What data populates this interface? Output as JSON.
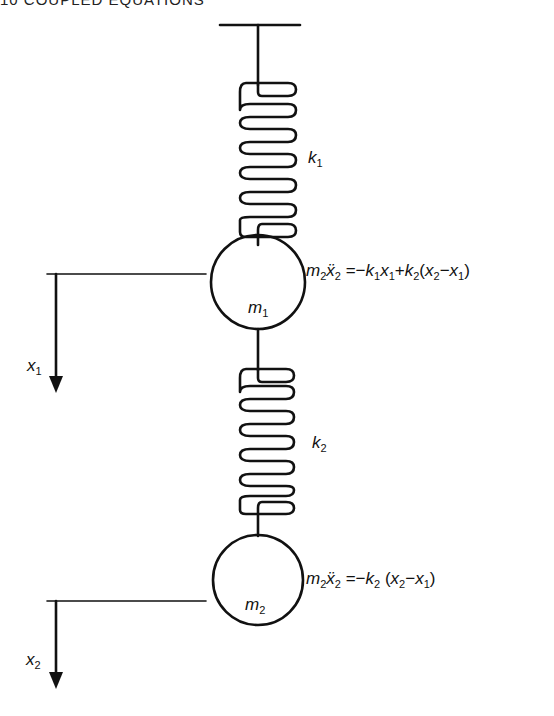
{
  "page": {
    "header": "10   COUPLED EQUATIONS"
  },
  "diagram": {
    "spring1": {
      "symbol": "k",
      "index": "1"
    },
    "spring2": {
      "symbol": "k",
      "index": "2"
    },
    "mass1": {
      "symbol": "m",
      "index": "1"
    },
    "mass2": {
      "symbol": "m",
      "index": "2"
    },
    "displacement1": {
      "symbol": "x",
      "index": "1"
    },
    "displacement2": {
      "symbol": "x",
      "index": "2"
    },
    "equation1": {
      "lhs_m": "m",
      "lhs_m_idx": "2",
      "lhs_x": "ẍ",
      "lhs_x_idx": "2",
      "eq": "=",
      "t1_sign": "−",
      "t1_k": "k",
      "t1_k_idx": "1",
      "t1_x": "x",
      "t1_x_idx": "1",
      "t2_sign": "+",
      "t2_k": "k",
      "t2_k_idx": "2",
      "open": "(",
      "a": "x",
      "a_idx": "2",
      "minus": "−",
      "b": "x",
      "b_idx": "1",
      "close": ")"
    },
    "equation2": {
      "lhs_m": "m",
      "lhs_m_idx": "2",
      "lhs_x": "ẍ",
      "lhs_x_idx": "2",
      "eq": "=",
      "t1_sign": "−",
      "t1_k": "k",
      "t1_k_idx": "2",
      "open": "(",
      "a": "x",
      "a_idx": "2",
      "minus": "−",
      "b": "x",
      "b_idx": "1",
      "close": ")"
    },
    "colors": {
      "ink": "#111111",
      "background": "#ffffff"
    }
  }
}
